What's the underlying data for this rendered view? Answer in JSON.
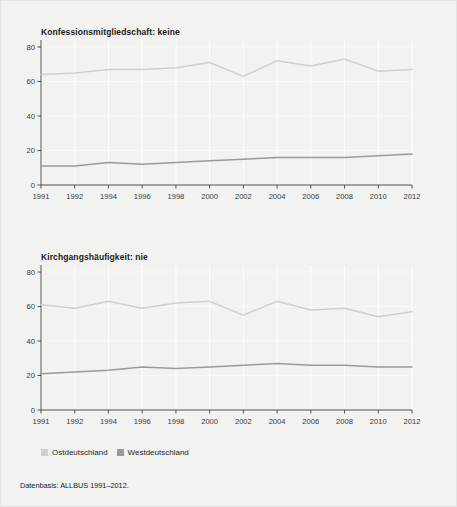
{
  "figure": {
    "background_color": "#f2f2f0",
    "border_color": "#e3e3e0"
  },
  "legend": {
    "position": "bottom-left",
    "items": [
      {
        "label": "Ostdeutschland",
        "color": "#cfcfcf"
      },
      {
        "label": "Westdeutschland",
        "color": "#9a9a9a"
      }
    ]
  },
  "footnote": {
    "text": "Datenbasis: ALLBUS 1991–2012."
  },
  "chart_data": [
    {
      "type": "line",
      "title": "Konfessionsmitgliedschaft: keine",
      "xlabel": "",
      "ylabel": "",
      "categories": [
        "1991",
        "1992",
        "1994",
        "1996",
        "1998",
        "2000",
        "2002",
        "2004",
        "2006",
        "2008",
        "2010",
        "2012"
      ],
      "ylim": [
        0,
        80
      ],
      "yticks": [
        0,
        20,
        40,
        60,
        80
      ],
      "grid": true,
      "legend": "bottom",
      "series": [
        {
          "name": "Ostdeutschland",
          "color": "#cfcfcf",
          "values": [
            64,
            65,
            67,
            67,
            68,
            71,
            63,
            72,
            69,
            73,
            66,
            67
          ]
        },
        {
          "name": "Westdeutschland",
          "color": "#9a9a9a",
          "values": [
            11,
            11,
            13,
            12,
            13,
            14,
            15,
            16,
            16,
            16,
            17,
            18
          ]
        }
      ]
    },
    {
      "type": "line",
      "title": "Kirchgangshäufigkeit: nie",
      "xlabel": "",
      "ylabel": "",
      "categories": [
        "1991",
        "1992",
        "1994",
        "1996",
        "1998",
        "2000",
        "2002",
        "2004",
        "2006",
        "2008",
        "2010",
        "2012"
      ],
      "ylim": [
        0,
        80
      ],
      "yticks": [
        0,
        20,
        40,
        60,
        80
      ],
      "grid": true,
      "legend": "bottom",
      "series": [
        {
          "name": "Ostdeutschland",
          "color": "#cfcfcf",
          "values": [
            61,
            59,
            63,
            59,
            62,
            63,
            55,
            63,
            58,
            59,
            54,
            57
          ]
        },
        {
          "name": "Westdeutschland",
          "color": "#9a9a9a",
          "values": [
            21,
            22,
            23,
            25,
            24,
            25,
            26,
            27,
            26,
            26,
            25,
            25
          ]
        }
      ]
    }
  ]
}
